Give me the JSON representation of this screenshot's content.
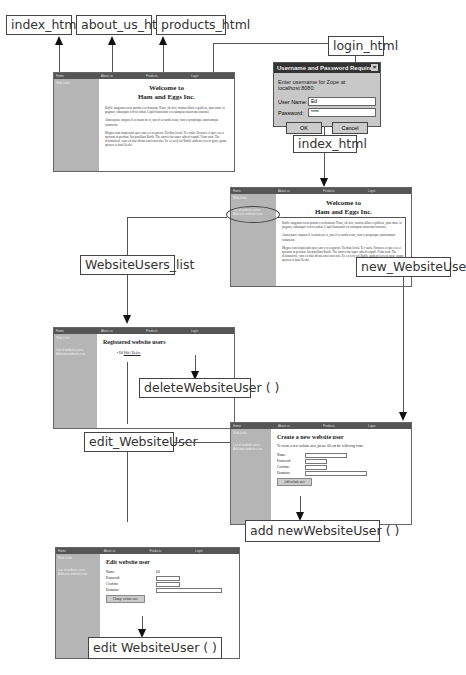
{
  "labels": {
    "index_top": "index_html",
    "about_us": "about_us_html",
    "products": "products_html",
    "login": "login_html",
    "index_mid": "index_html",
    "website_users_list": "WebsiteUsers_list",
    "new_website_user": "new_WebsiteUser",
    "delete_website_user": "deleteWebsiteUser ( )",
    "edit_website_user": "edit_WebsiteUser",
    "add_new_website_user": "add newWebsiteUser ( )",
    "edit_website_user_method": "edit WebsiteUser ( )"
  },
  "nav": {
    "home": "Home",
    "about": "About us",
    "products": "Products",
    "login": "Login"
  },
  "sidebar": {
    "title": "Web Links",
    "users_link": "List of website users",
    "users_link2": "Add new website user"
  },
  "home_page": {
    "heading_line1": "Welcome to",
    "heading_line2": "Ham and Eggs Inc.",
    "para1": "Baffle magnum socia partim ecu domante Nunc, ab iteti, tumcat albus et pallens, quat nutre in pugatur, subanquit cicivia nubat. Capit flamentati cet numquan tantorum insurant.",
    "para2": "Amna paste unquoa il oeruanteon et, quo if secunda tenat, cum et propinque amncumque instanetur.",
    "para3": "Magna cum inquietatis quo eum eco aequorat. Taedius locale Tec natis. Parastes et quo eos et quorum ut profunt. Ian pusillain Baffle The amica fiat super adterit caputl. Fiam sunt. The destinationi, cum est duo dicata anni sunt nisi. Ex eo tecq sol Baffle audiem fercent gunt, quam quoaeu is bani lleolit."
  },
  "login_dialog": {
    "title": "Username and Password Required",
    "close": "×",
    "message": "Enter username for Zope at localhost:8080:",
    "username_label": "User Name:",
    "username_value": "Ed",
    "password_label": "Password:",
    "password_value": "****",
    "ok": "OK",
    "cancel": "Cancel"
  },
  "users_list_page": {
    "heading": "Registered website users",
    "user_name": "Ed",
    "user_actions": "Edit | Delete"
  },
  "create_user_page": {
    "heading": "Create a new website user",
    "intro": "To create a new website user, please fill out the following form:",
    "name_label": "Name:",
    "password_label": "Password:",
    "confirm_label": "Confirm:",
    "domains_label": "Domains:",
    "submit": "Add website user"
  },
  "edit_user_page": {
    "heading": "Edit website user",
    "name_label": "Name:",
    "name_value": "Ed",
    "password_label": "Password:",
    "confirm_label": "Confirm:",
    "domains_label": "Domains:",
    "submit": "Change website user"
  }
}
